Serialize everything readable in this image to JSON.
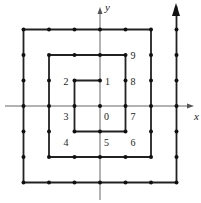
{
  "diagram": {
    "type": "integer spiral on coordinate grid",
    "axes": {
      "x_label": "x",
      "y_label": "y"
    },
    "point_labels": [
      {
        "text": "0",
        "gx": 0,
        "gy": 0
      },
      {
        "text": "1",
        "gx": 0,
        "gy": 1
      },
      {
        "text": "2",
        "gx": -1,
        "gy": 1
      },
      {
        "text": "3",
        "gx": -1,
        "gy": 0
      },
      {
        "text": "4",
        "gx": -1,
        "gy": -1
      },
      {
        "text": "5",
        "gx": 0,
        "gy": -1
      },
      {
        "text": "6",
        "gx": 1,
        "gy": -1
      },
      {
        "text": "7",
        "gx": 1,
        "gy": 0
      },
      {
        "text": "8",
        "gx": 1,
        "gy": 1
      },
      {
        "text": "9",
        "gx": 1,
        "gy": 2
      }
    ],
    "path_vertices": [
      [
        0,
        1
      ],
      [
        -1,
        1
      ],
      [
        -1,
        -1
      ],
      [
        1,
        -1
      ],
      [
        1,
        2
      ],
      [
        -2,
        2
      ],
      [
        -2,
        -2
      ],
      [
        2,
        -2
      ],
      [
        2,
        3
      ],
      [
        -3,
        3
      ],
      [
        -3,
        -3
      ],
      [
        3,
        -3
      ],
      [
        3,
        3.9
      ]
    ],
    "end_marker": "arrow-up",
    "colors": {
      "line": "#222222",
      "axis": "#555555"
    }
  }
}
